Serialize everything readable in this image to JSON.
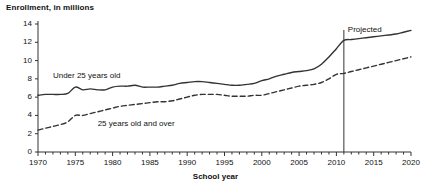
{
  "chart_data": {
    "type": "line",
    "title": "Enrollment, in millions",
    "xlabel": "School year",
    "ylabel": "",
    "xlim": [
      1970,
      2020
    ],
    "ylim": [
      0,
      14
    ],
    "grid": false,
    "legend_position": "inline-annotation",
    "y_ticks": [
      0,
      2,
      4,
      6,
      8,
      10,
      12,
      14
    ],
    "y_tick_labels": [
      "0",
      "2",
      "4",
      "6",
      "8",
      "10",
      "12",
      "14"
    ],
    "x_ticks": [
      1970,
      1975,
      1980,
      1985,
      1990,
      1995,
      2000,
      2005,
      2010,
      2015,
      2020
    ],
    "x_tick_labels": [
      "1970",
      "1975",
      "1980",
      "1985",
      "1990",
      "1995",
      "2000",
      "2005",
      "2010",
      "2015",
      "2020"
    ],
    "x_minor_tick_step": 1,
    "annotations": [
      {
        "name": "projected-divider",
        "label": "Projected",
        "x": 2011,
        "type": "vertical-line"
      }
    ],
    "series": [
      {
        "name": "Under 25 years old",
        "style": "solid",
        "color": "#333333",
        "label_x": 1972,
        "label_y": 8.35,
        "x": [
          1970,
          1971,
          1972,
          1973,
          1974,
          1975,
          1976,
          1977,
          1978,
          1979,
          1980,
          1981,
          1982,
          1983,
          1984,
          1985,
          1986,
          1987,
          1988,
          1989,
          1990,
          1991,
          1992,
          1993,
          1994,
          1995,
          1996,
          1997,
          1998,
          1999,
          2000,
          2001,
          2002,
          2003,
          2004,
          2005,
          2006,
          2007,
          2008,
          2009,
          2010,
          2011,
          2012,
          2013,
          2014,
          2015,
          2016,
          2017,
          2018,
          2019,
          2020
        ],
        "values": [
          6.2,
          6.3,
          6.3,
          6.3,
          6.4,
          7.1,
          6.8,
          6.9,
          6.8,
          6.8,
          7.1,
          7.2,
          7.2,
          7.3,
          7.1,
          7.1,
          7.1,
          7.2,
          7.3,
          7.5,
          7.6,
          7.7,
          7.7,
          7.6,
          7.5,
          7.4,
          7.3,
          7.3,
          7.4,
          7.5,
          7.8,
          8.0,
          8.3,
          8.5,
          8.7,
          8.8,
          8.9,
          9.1,
          9.6,
          10.4,
          11.3,
          12.2,
          12.3,
          12.4,
          12.5,
          12.6,
          12.7,
          12.8,
          12.9,
          13.1,
          13.3
        ]
      },
      {
        "name": "25 years old and over",
        "style": "dashed",
        "color": "#333333",
        "label_x": 1978,
        "label_y": 3.05,
        "x": [
          1970,
          1971,
          1972,
          1973,
          1974,
          1975,
          1976,
          1977,
          1978,
          1979,
          1980,
          1981,
          1982,
          1983,
          1984,
          1985,
          1986,
          1987,
          1988,
          1989,
          1990,
          1991,
          1992,
          1993,
          1994,
          1995,
          1996,
          1997,
          1998,
          1999,
          2000,
          2001,
          2002,
          2003,
          2004,
          2005,
          2006,
          2007,
          2008,
          2009,
          2010,
          2011,
          2012,
          2013,
          2014,
          2015,
          2016,
          2017,
          2018,
          2019,
          2020
        ],
        "values": [
          2.4,
          2.6,
          2.8,
          3.0,
          3.3,
          4.0,
          4.0,
          4.2,
          4.4,
          4.6,
          4.8,
          5.0,
          5.1,
          5.2,
          5.3,
          5.4,
          5.5,
          5.5,
          5.6,
          5.8,
          6.0,
          6.2,
          6.3,
          6.3,
          6.3,
          6.2,
          6.1,
          6.1,
          6.1,
          6.2,
          6.2,
          6.4,
          6.6,
          6.8,
          7.0,
          7.2,
          7.3,
          7.4,
          7.6,
          8.0,
          8.5,
          8.6,
          8.8,
          9.0,
          9.2,
          9.4,
          9.6,
          9.8,
          10.0,
          10.2,
          10.4
        ]
      }
    ]
  }
}
